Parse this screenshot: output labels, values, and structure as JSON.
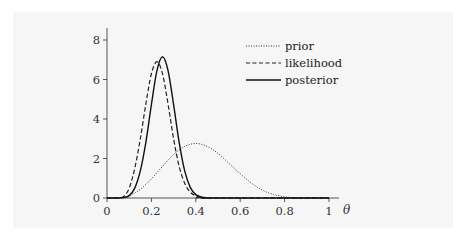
{
  "chart_data": {
    "type": "line",
    "title": "",
    "xlabel": "θ",
    "ylabel": "",
    "xlim": [
      0,
      1
    ],
    "ylim": [
      0,
      8.5
    ],
    "grid": false,
    "legend_position": "upper right",
    "x_ticks": [
      "0",
      "0.2",
      "0.4",
      "0.6",
      "0.8",
      "1"
    ],
    "y_ticks": [
      "0",
      "2",
      "4",
      "6",
      "8"
    ],
    "series": [
      {
        "name": "prior",
        "style": "dotted",
        "x": [
          0,
          0.05,
          0.1,
          0.15,
          0.2,
          0.25,
          0.3,
          0.35,
          0.4,
          0.45,
          0.5,
          0.55,
          0.6,
          0.65,
          0.7,
          0.75,
          0.8,
          0.85,
          0.9,
          1.0
        ],
        "values": [
          0,
          0.01,
          0.12,
          0.44,
          0.97,
          1.6,
          2.2,
          2.61,
          2.76,
          2.62,
          2.26,
          1.75,
          1.23,
          0.76,
          0.4,
          0.18,
          0.06,
          0.01,
          0,
          0
        ]
      },
      {
        "name": "likelihood",
        "style": "dashed",
        "x": [
          0,
          0.05,
          0.075,
          0.1,
          0.125,
          0.15,
          0.175,
          0.2,
          0.225,
          0.25,
          0.275,
          0.3,
          0.325,
          0.35,
          0.375,
          0.4,
          0.425,
          0.45,
          1.0
        ],
        "values": [
          0,
          0,
          0.08,
          0.5,
          1.5,
          2.99,
          4.76,
          6.29,
          6.9,
          6.29,
          4.76,
          3.0,
          1.6,
          0.75,
          0.3,
          0.1,
          0.03,
          0,
          0
        ]
      },
      {
        "name": "posterior",
        "style": "solid",
        "x": [
          0,
          0.05,
          0.075,
          0.1,
          0.125,
          0.15,
          0.175,
          0.2,
          0.225,
          0.25,
          0.275,
          0.3,
          0.325,
          0.35,
          0.375,
          0.4,
          0.425,
          0.45,
          0.475,
          1.0
        ],
        "values": [
          0,
          0,
          0.02,
          0.12,
          0.5,
          1.37,
          2.82,
          4.73,
          6.45,
          7.15,
          6.45,
          4.73,
          2.82,
          1.37,
          0.54,
          0.17,
          0.05,
          0.01,
          0,
          0
        ]
      }
    ]
  },
  "legend": {
    "items": [
      {
        "label": "prior",
        "style": "dotted"
      },
      {
        "label": "likelihood",
        "style": "dashed"
      },
      {
        "label": "posterior",
        "style": "solid"
      }
    ]
  },
  "colors": {
    "line": "#222222",
    "axis": "#555555",
    "panel_background": "#f6f6f6"
  }
}
